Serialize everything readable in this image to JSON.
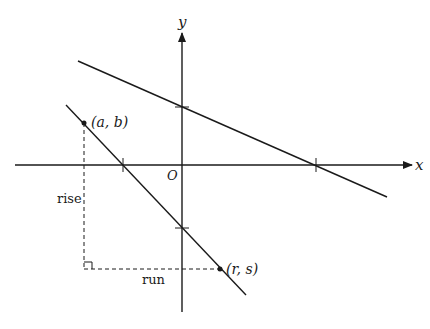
{
  "diagram": {
    "type": "coordinate-plane",
    "axes": {
      "x_label": "x",
      "y_label": "y",
      "origin_label": "O"
    },
    "lines": [
      {
        "name": "upper-line",
        "description": "line with negative slope crossing positive y-axis and positive x-axis"
      },
      {
        "name": "lower-line",
        "description": "steeper line with negative slope crossing negative x-axis and negative y-axis"
      }
    ],
    "points": [
      {
        "name": "point-a-b",
        "label": "(a, b)"
      },
      {
        "name": "point-r-s",
        "label": "(r, s)"
      }
    ],
    "annotations": {
      "rise_label": "rise",
      "run_label": "run"
    },
    "colors": {
      "stroke": "#1a1a1a",
      "background": "#ffffff"
    }
  }
}
